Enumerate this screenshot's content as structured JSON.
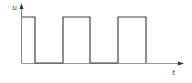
{
  "diagram": {
    "type": "square-wave",
    "y_axis_label": "u",
    "x_axis_label": "t",
    "colors": {
      "axis": "#888888",
      "wave": "#444444",
      "background": "#ffffff"
    },
    "high_level_y": 17,
    "low_level_y": 63,
    "pulses": [
      {
        "start_x": 22,
        "end_x": 35
      },
      {
        "start_x": 63,
        "end_x": 90
      },
      {
        "start_x": 118,
        "end_x": 146
      }
    ]
  }
}
